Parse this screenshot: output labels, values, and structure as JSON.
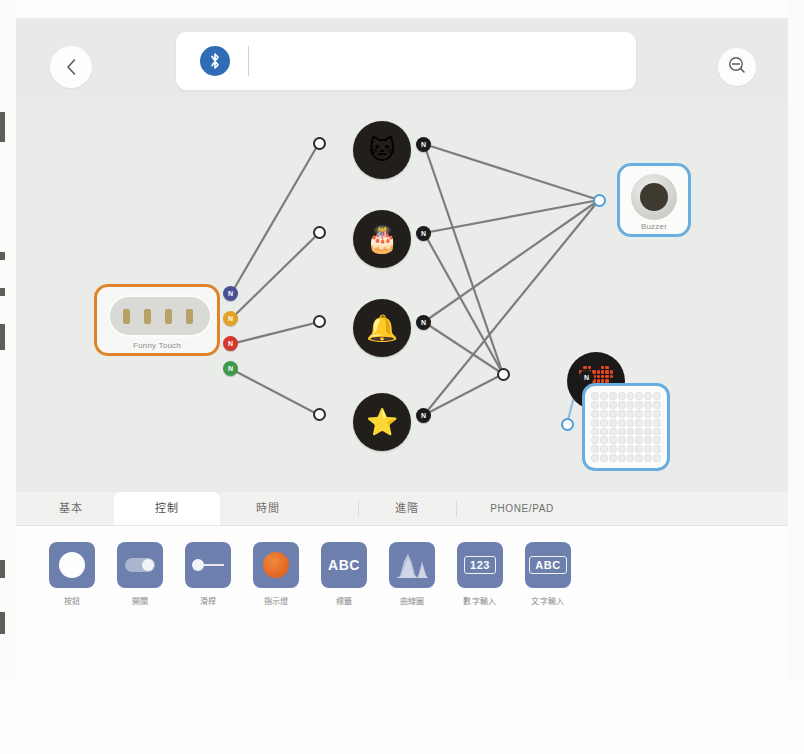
{
  "app": {
    "title": "Makeblock Neuron Flow Editor"
  },
  "topbar": {
    "back_icon": "chevron-left-icon",
    "bluetooth_icon": "bluetooth-icon",
    "zoom_out_icon": "zoom-out-icon",
    "name_value": "",
    "name_placeholder": ""
  },
  "canvas": {
    "devices": [
      {
        "id": "funny-touch",
        "name": "Funny Touch",
        "label": "Funny Touch",
        "border_color": "#e0842c",
        "x": 78,
        "y": 182,
        "w": 126,
        "h": 72,
        "ports": [
          {
            "label": "N",
            "color_name": "navy",
            "color": "#4b4f96",
            "x": 207,
            "y": 184
          },
          {
            "label": "N",
            "color_name": "amber",
            "color": "#e2a324",
            "x": 207,
            "y": 209
          },
          {
            "label": "N",
            "color_name": "red",
            "color": "#d4372d",
            "x": 207,
            "y": 234
          },
          {
            "label": "N",
            "color_name": "green",
            "color": "#3f9a4d",
            "x": 207,
            "y": 259
          }
        ]
      },
      {
        "id": "buzzer",
        "name": "Buzzer",
        "label": "Buzzer",
        "border_color": "#6aaee0",
        "x": 601,
        "y": 61,
        "w": 74,
        "h": 74
      },
      {
        "id": "led-matrix",
        "name": "LED Matrix",
        "label": "",
        "border_color": "#6aaee0",
        "x": 566,
        "y": 281,
        "w": 88,
        "h": 88,
        "grid": {
          "cols": 8,
          "rows": 8
        }
      }
    ],
    "sound_nodes": [
      {
        "id": "node-cat",
        "emoji": "🐱",
        "icon_name": "cat-face-icon",
        "x": 337,
        "y": 19,
        "in_x": 303,
        "in_y": 41,
        "out_x": 400,
        "out_y": 42,
        "out_label": "N"
      },
      {
        "id": "node-cake",
        "emoji": "🎂",
        "icon_name": "birthday-cake-icon",
        "x": 337,
        "y": 108,
        "in_x": 303,
        "in_y": 131,
        "out_x": 400,
        "out_y": 131,
        "out_label": "N"
      },
      {
        "id": "node-bell",
        "emoji": "🔔",
        "icon_name": "bells-icon",
        "x": 337,
        "y": 197,
        "in_x": 303,
        "in_y": 220,
        "out_x": 400,
        "out_y": 220,
        "out_label": "N"
      },
      {
        "id": "node-star",
        "emoji": "⭐",
        "icon_name": "star-icon",
        "x": 337,
        "y": 291,
        "in_x": 303,
        "in_y": 313,
        "out_x": 400,
        "out_y": 313,
        "out_label": "N"
      }
    ],
    "heart_node": {
      "id": "node-heart",
      "icon_name": "pixel-heart-icon",
      "color": "#e1441f",
      "x": 551,
      "y": 250,
      "in_x": 487,
      "in_y": 272,
      "out_x": 563,
      "out_y": 275,
      "out_label": "N"
    },
    "buzzer_input": {
      "x": 583,
      "y": 98
    },
    "matrix_input": {
      "x": 551,
      "y": 322
    },
    "wire_color": "#7c7e7c",
    "wire_color_blue": "#7fb5df"
  },
  "panel": {
    "tabs": [
      {
        "id": "tab-basic",
        "label": "基本",
        "active": false,
        "x": 12,
        "w": 86
      },
      {
        "id": "tab-control",
        "label": "控制",
        "active": true,
        "x": 98,
        "w": 106
      },
      {
        "id": "tab-time",
        "label": "時間",
        "active": false,
        "x": 204,
        "w": 96
      },
      {
        "id": "tab-advanced",
        "label": "進階",
        "active": false,
        "x": 304,
        "w": 96
      },
      {
        "id": "tab-phone-pad",
        "label": "PHONE/PAD",
        "active": false,
        "x": 400,
        "w": 120
      }
    ],
    "widgets": [
      {
        "id": "widget-button",
        "label": "按鈕",
        "icon": "circle-button-icon",
        "glyph": "circle",
        "x": 24
      },
      {
        "id": "widget-switch",
        "label": "開關",
        "icon": "toggle-switch-icon",
        "glyph": "switch",
        "x": 92
      },
      {
        "id": "widget-slider",
        "label": "滑桿",
        "icon": "slider-icon",
        "glyph": "slider",
        "x": 160
      },
      {
        "id": "widget-indicator",
        "label": "指示燈",
        "icon": "indicator-lamp-icon",
        "glyph": "orange",
        "x": 228
      },
      {
        "id": "widget-label",
        "label": "標籤",
        "icon": "label-abc-icon",
        "glyph": "ABC",
        "x": 296
      },
      {
        "id": "widget-curve-chart",
        "label": "曲線圖",
        "icon": "curve-chart-icon",
        "glyph": "curve",
        "x": 364
      },
      {
        "id": "widget-number-input",
        "label": "數字輸入",
        "icon": "number-input-icon",
        "glyph": "123",
        "x": 432
      },
      {
        "id": "widget-text-input",
        "label": "文字輸入",
        "icon": "text-input-icon",
        "glyph": "ABC",
        "x": 500
      }
    ]
  },
  "colors": {
    "accent_blue": "#2f6cb5",
    "device_orange": "#e0842c",
    "device_blue": "#6aaee0",
    "widget_blue": "#6d7fad",
    "canvas_bg": "#eaecea"
  }
}
